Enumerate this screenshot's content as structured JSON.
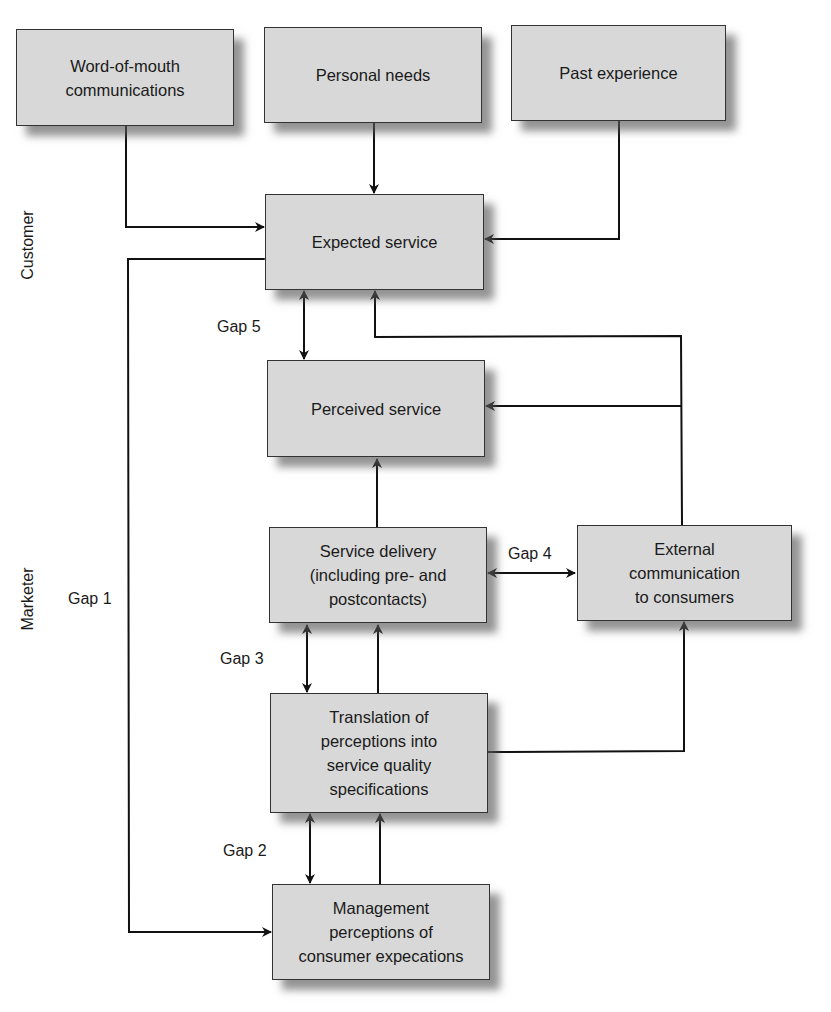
{
  "diagram": {
    "type": "service quality gap model",
    "lanes": {
      "customer": "Customer",
      "marketer": "Marketer"
    },
    "boxes": {
      "word_of_mouth": "Word-of-mouth\ncommunications",
      "personal_needs": "Personal needs",
      "past_experience": "Past experience",
      "expected_service": "Expected service",
      "perceived_service": "Perceived service",
      "service_delivery": "Service delivery\n(including pre- and\npostcontacts)",
      "external_communication": "External\ncommunication\nto consumers",
      "translation": "Translation of\nperceptions into\nservice quality\nspecifications",
      "management_perceptions": "Management\nperceptions of\nconsumer expecations"
    },
    "gaps": {
      "gap1": "Gap 1",
      "gap2": "Gap 2",
      "gap3": "Gap 3",
      "gap4": "Gap 4",
      "gap5": "Gap 5"
    },
    "edges": [
      {
        "from": "Word-of-mouth communications",
        "to": "Expected service"
      },
      {
        "from": "Personal needs",
        "to": "Expected service"
      },
      {
        "from": "Past experience",
        "to": "Expected service"
      },
      {
        "from": "Expected service",
        "to": "Perceived service",
        "bidirectional": true,
        "label": "Gap 5"
      },
      {
        "from": "External communication to consumers",
        "to": "Expected service"
      },
      {
        "from": "External communication to consumers",
        "to": "Perceived service"
      },
      {
        "from": "Service delivery",
        "to": "Perceived service"
      },
      {
        "from": "Service delivery",
        "to": "External communication to consumers",
        "bidirectional": true,
        "label": "Gap 4"
      },
      {
        "from": "Service delivery",
        "to": "Translation of perceptions",
        "bidirectional": true,
        "label": "Gap 3"
      },
      {
        "from": "Translation of perceptions",
        "to": "Service delivery"
      },
      {
        "from": "Translation of perceptions",
        "to": "External communication to consumers"
      },
      {
        "from": "Translation of perceptions",
        "to": "Management perceptions",
        "bidirectional": true,
        "label": "Gap 2"
      },
      {
        "from": "Management perceptions",
        "to": "Translation of perceptions"
      },
      {
        "from": "Expected service",
        "to": "Management perceptions",
        "bidirectional": true,
        "label": "Gap 1"
      }
    ]
  }
}
